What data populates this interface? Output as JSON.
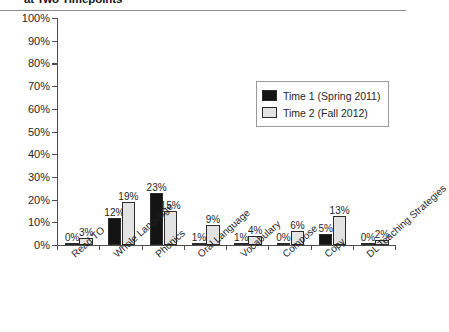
{
  "chart_data": {
    "type": "bar",
    "title": "at Two Timepoints",
    "xlabel": "",
    "ylabel": "",
    "ylim": [
      0,
      100
    ],
    "grid": false,
    "legend_position": "upper-right",
    "y_ticks": [
      "100%",
      "90%",
      "80%",
      "70%",
      "60%",
      "50%",
      "40%",
      "30%",
      "20%",
      "10%",
      "0%"
    ],
    "y_tick_values": [
      100,
      90,
      80,
      70,
      60,
      50,
      40,
      30,
      20,
      10,
      0
    ],
    "categories": [
      "Read TO",
      "Whole Language",
      "Phonics",
      "Oral Language",
      "Vocabulary",
      "Compose",
      "Copy",
      "DL Teaching Strategies"
    ],
    "series": [
      {
        "name": "Time 1 (Spring 2011)",
        "color": "#141414",
        "values": [
          0,
          12,
          23,
          1,
          1,
          0,
          5,
          0
        ],
        "labels": [
          "0%",
          "12%",
          "23%",
          "1%",
          "1%",
          "0%",
          "5%",
          "0%"
        ]
      },
      {
        "name": "Time 2 (Fall 2012)",
        "color": "#e3e3e3",
        "values": [
          3,
          19,
          15,
          9,
          4,
          6,
          13,
          2
        ],
        "labels": [
          "3%",
          "19%",
          "15%",
          "9%",
          "4%",
          "6%",
          "13%",
          "2%"
        ]
      }
    ]
  },
  "legend": {
    "entries": [
      {
        "label": "Time 1 (Spring 2011)"
      },
      {
        "label": "Time 2 (Fall 2012)"
      }
    ]
  }
}
